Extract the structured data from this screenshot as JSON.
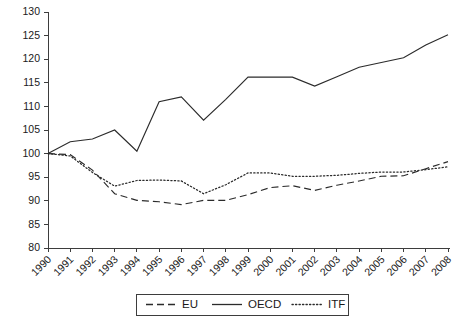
{
  "chart_data": {
    "type": "line",
    "title": "",
    "subtitle": "",
    "xlabel": "",
    "ylabel": "",
    "categories": [
      "1990",
      "1991",
      "1992",
      "1993",
      "1994",
      "1995",
      "1996",
      "1997",
      "1998",
      "1999",
      "2000",
      "2001",
      "2002",
      "2003",
      "2004",
      "2005",
      "2006",
      "2007",
      "2008"
    ],
    "x": [
      1990,
      1991,
      1992,
      1993,
      1994,
      1995,
      1996,
      1997,
      1998,
      1999,
      2000,
      2001,
      2002,
      2003,
      2004,
      2005,
      2006,
      2007,
      2008
    ],
    "series": [
      {
        "name": "EU",
        "style": "dashed",
        "values": [
          100,
          99.8,
          96.5,
          91.5,
          90.1,
          89.8,
          89.2,
          90.1,
          90.1,
          91.3,
          92.8,
          93.2,
          92.2,
          93.3,
          94.2,
          95.2,
          95.3,
          96.8,
          98.3
        ]
      },
      {
        "name": "OECD",
        "style": "solid",
        "values": [
          100,
          102.5,
          103.1,
          105.0,
          100.5,
          111.0,
          112.0,
          107.1,
          111.5,
          116.2,
          116.2,
          116.2,
          114.3,
          116.3,
          118.3,
          119.3,
          120.3,
          123.0,
          125.2
        ]
      },
      {
        "name": "ITF",
        "style": "dotted",
        "values": [
          100,
          99.5,
          96.0,
          93.1,
          94.3,
          94.4,
          94.2,
          91.5,
          93.4,
          95.9,
          95.9,
          95.2,
          95.2,
          95.4,
          95.8,
          96.1,
          96.1,
          96.6,
          97.2
        ]
      }
    ],
    "ylim": [
      80,
      130
    ],
    "ytick_step": 5,
    "yticks": [
      80,
      85,
      90,
      95,
      100,
      105,
      110,
      115,
      120,
      125,
      130
    ],
    "xlim": [
      1990,
      2008
    ],
    "grid": false,
    "legend_position": "bottom-center",
    "legend_entries": [
      "EU",
      "OECD",
      "ITF"
    ],
    "colors": {
      "axis": "#3d3d3d",
      "series": "#2b2b2b",
      "background": "#ffffff"
    }
  },
  "legend": {
    "eu_label": "EU",
    "oecd_label": "OECD",
    "itf_label": "ITF"
  }
}
